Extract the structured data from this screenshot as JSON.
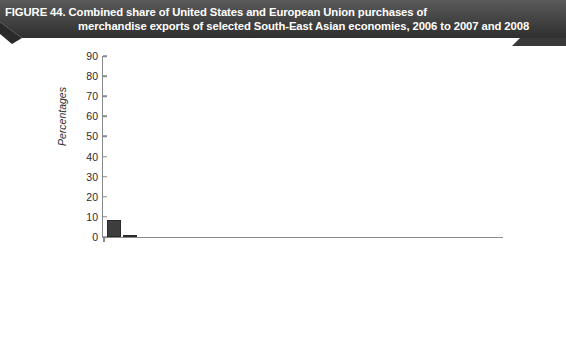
{
  "figure": {
    "banner_line1": "FIGURE 44. Combined share of United States and European Union purchases of",
    "banner_line2": "merchandise exports of selected South-East Asian economies, 2006 to 2007 and 2008",
    "banner_color": "#4a4a4a",
    "bar_color": "#3d3d3d",
    "axis_color": "#8a8a8a"
  },
  "chart_data": {
    "type": "bar",
    "title": "FIGURE 44. Combined share of United States and European Union purchases of merchandise exports of selected South-East Asian economies, 2006 to 2007 and 2008",
    "xlabel": "",
    "ylabel": "Percentages",
    "ylim": [
      0,
      90
    ],
    "yticks": [
      0,
      10,
      20,
      30,
      40,
      50,
      60,
      70,
      80,
      90
    ],
    "grid": false,
    "legend_position": "bottom",
    "categories": [
      "Brunei Darussalam",
      "Cambodia",
      "Indonesia",
      "Lao People's Democratic Republic",
      "Malaysia",
      "Myanmar",
      "Philippines",
      "Singapore",
      "Thailand",
      "Viet Nam"
    ],
    "category_lines": [
      [
        "Brunei",
        "Darussalam"
      ],
      [
        "Cambodia",
        ""
      ],
      [
        "Indonesia",
        ""
      ],
      [
        "Lao People's",
        "Democratic Republic"
      ],
      [
        "Malaysia",
        ""
      ],
      [
        "Myanmar",
        ""
      ],
      [
        "Philippines",
        ""
      ],
      [
        "Singapore",
        ""
      ],
      [
        "Thailand",
        ""
      ],
      [
        "Viet Nam",
        ""
      ]
    ],
    "series": [
      {
        "name": "Average  2006-2007",
        "values": [
          8.5,
          76.0,
          22.5,
          12.0,
          30.5,
          7.5,
          35.0,
          21.0,
          27.0,
          38.5
        ]
      },
      {
        "name": "2008",
        "values": [
          1.0,
          77.0,
          21.0,
          13.5,
          25.0,
          4.0,
          34.0,
          18.0,
          24.0,
          36.0
        ]
      }
    ]
  },
  "legend": {
    "items": [
      {
        "label": "Average  2006-2007"
      },
      {
        "label": "2008"
      }
    ]
  }
}
